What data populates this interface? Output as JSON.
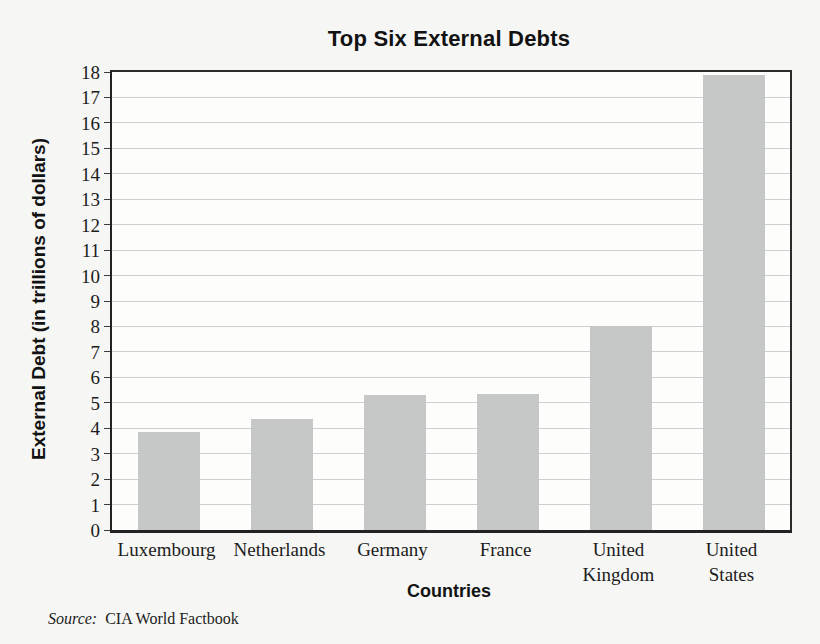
{
  "chart_data": {
    "type": "bar",
    "title": "Top Six External Debts",
    "categories": [
      "Luxembourg",
      "Netherlands",
      "Germany",
      "France",
      "United Kingdom",
      "United States"
    ],
    "values": [
      3.85,
      4.35,
      5.3,
      5.35,
      8.0,
      17.9
    ],
    "xlabel": "Countries",
    "ylabel": "External Debt (in trillions of dollars)",
    "ylim": [
      0,
      18
    ],
    "ytick_step": 1,
    "grid": true,
    "legend": "none",
    "bar_color": "#c6c7c7",
    "source_label": "Source:",
    "source_text": "CIA World Factbook"
  }
}
